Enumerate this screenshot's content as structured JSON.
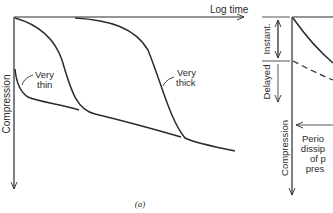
{
  "panel_a": {
    "x_axis_label": "Log time",
    "y_axis_label": "Compression",
    "curve_labels": {
      "very_thin": [
        "Very",
        "thin"
      ],
      "very_thick": [
        "Very",
        "thick"
      ]
    },
    "caption": "(a)"
  },
  "panel_b": {
    "y_axis_label": "Compression",
    "bracket_instant": "Instant.",
    "bracket_delayed": "Delayed",
    "annotation_lines": [
      "Perio",
      "dissip",
      "of p",
      "pres"
    ]
  },
  "colors": {
    "ink": "#2b2b2b",
    "background": "#ffffff"
  }
}
